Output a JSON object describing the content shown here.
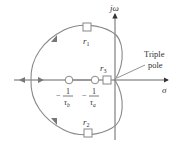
{
  "diagram": {
    "type": "root-locus",
    "axes": {
      "imag_label": "jω",
      "real_label": "σ"
    },
    "annotation": {
      "line1": "Triple",
      "line2": "pole"
    },
    "roots": {
      "r1": {
        "base": "r",
        "sub": "1"
      },
      "r2": {
        "base": "r",
        "sub": "2"
      },
      "r3": {
        "base": "r",
        "sub": "3"
      }
    },
    "zeros": [
      {
        "sign": "−",
        "num": "1",
        "den_base": "τ",
        "den_sub": "b"
      },
      {
        "sign": "−",
        "num": "1",
        "den_base": "τ",
        "den_sub": "a"
      }
    ],
    "colors": {
      "locus": "#888888",
      "axis": "#444444",
      "marker_fill": "#ffffff",
      "marker_stroke": "#888888"
    }
  }
}
